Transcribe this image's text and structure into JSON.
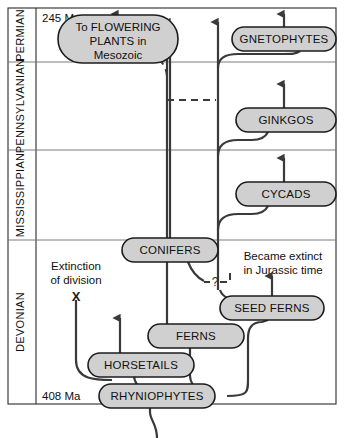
{
  "diagram": {
    "type": "phylogenetic-timeline",
    "colors": {
      "pill_fill": "#d0d0d0",
      "pill_stroke": "#1c1c1c",
      "lineage_stroke": "#3a3a3a",
      "frame_stroke": "#2b2b2b",
      "divider_stroke": "#6d6d6d",
      "background": "#ffffff"
    },
    "age_top": "245 Ma",
    "age_bottom": "408 Ma",
    "periods": [
      {
        "name": "PERMIAN",
        "y_top": 8,
        "y_bottom": 62
      },
      {
        "name": "PENNSYLVANIAN",
        "y_top": 62,
        "y_bottom": 150
      },
      {
        "name": "MISSISSIPPIAN",
        "y_top": 150,
        "y_bottom": 240
      },
      {
        "name": "DEVONIAN",
        "y_top": 240,
        "y_bottom": 404
      }
    ],
    "taxa": [
      {
        "id": "flowering",
        "label_lines": [
          "To FLOWERING",
          "PLANTS in",
          "Mesozoic"
        ],
        "cx": 118,
        "cy": 38
      },
      {
        "id": "gnetophytes",
        "label": "GNETOPHYTES",
        "cx": 284,
        "cy": 39
      },
      {
        "id": "ginkgos",
        "label": "GINKGOS",
        "cx": 284,
        "cy": 120
      },
      {
        "id": "cycads",
        "label": "CYCADS",
        "cx": 284,
        "cy": 194
      },
      {
        "id": "conifers",
        "label": "CONIFERS",
        "cx": 170,
        "cy": 250
      },
      {
        "id": "seed-ferns",
        "label": "SEED FERNS",
        "cx": 272,
        "cy": 308
      },
      {
        "id": "ferns",
        "label": "FERNS",
        "cx": 196,
        "cy": 336
      },
      {
        "id": "horsetails",
        "label": "HORSETAILS",
        "cx": 141,
        "cy": 365
      },
      {
        "id": "rhyniophytes",
        "label": "RHYNIOPHYTES",
        "cx": 157,
        "cy": 396
      }
    ],
    "annotations": [
      {
        "id": "extinction-note",
        "lines": [
          "Extinction",
          "of division"
        ],
        "cx": 76,
        "cy": 272
      },
      {
        "id": "extinct-mark",
        "label": "X",
        "cx": 76,
        "cy": 296
      },
      {
        "id": "jurassic-note",
        "lines": [
          "Became extinct",
          "in Jurassic time"
        ],
        "cx": 283,
        "cy": 262
      },
      {
        "id": "uncertain-link",
        "label": "?",
        "cx": 215,
        "cy": 282
      }
    ]
  }
}
